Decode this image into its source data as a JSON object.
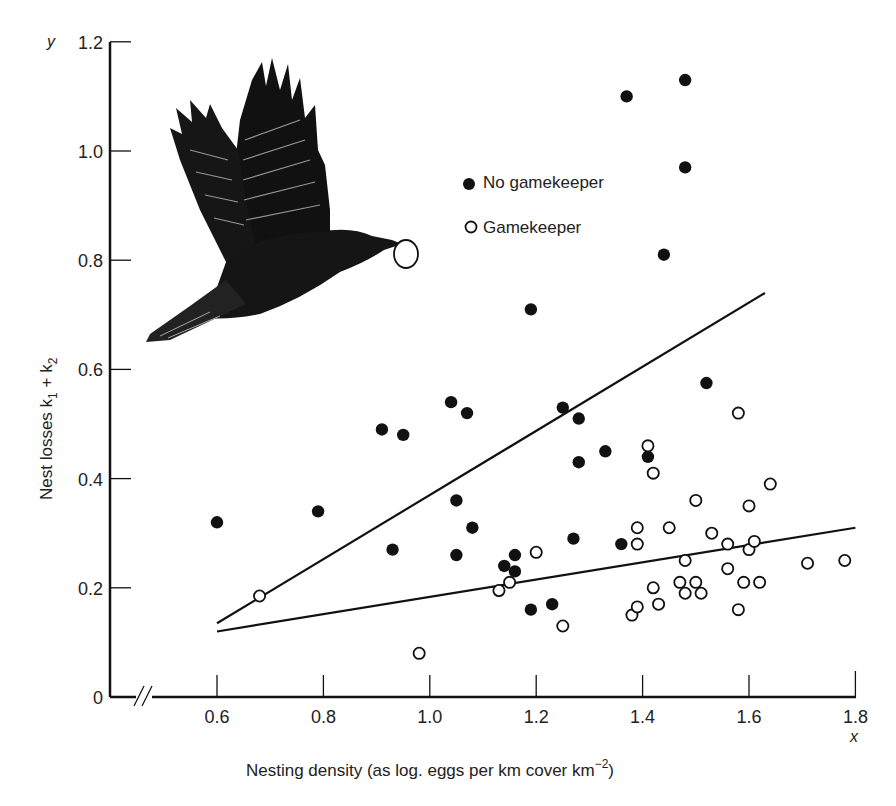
{
  "chart_data": {
    "type": "scatter",
    "title": "",
    "xlabel": "Nesting density (as log. eggs per km cover km",
    "xlabel_superscript": "−2",
    "xlabel_close": ")",
    "ylabel": "Nest losses k",
    "ylabel_sub1": "1",
    "ylabel_plus": " + k",
    "ylabel_sub2": "2",
    "x_var": "x",
    "y_var": "y",
    "xlim": [
      0.45,
      1.8
    ],
    "ylim": [
      0,
      1.2
    ],
    "x_ticks": [
      "0.6",
      "0.8",
      "1.0",
      "1.2",
      "1.4",
      "1.6",
      "1.8"
    ],
    "x_tick_values": [
      0.6,
      0.8,
      1.0,
      1.2,
      1.4,
      1.6,
      1.8
    ],
    "y_ticks": [
      "0",
      "0.2",
      "0.4",
      "0.6",
      "0.8",
      "1.0",
      "1.2"
    ],
    "y_tick_values": [
      0,
      0.2,
      0.4,
      0.6,
      0.8,
      1.0,
      1.2
    ],
    "axis_break": "x-axis broken between 0 and 0.6",
    "grid": false,
    "legend_position": "upper center",
    "illustration": "crow-carrying-egg-drawing",
    "series": [
      {
        "name": "No gamekeeper",
        "marker": "filled-circle",
        "points": [
          [
            0.6,
            0.32
          ],
          [
            0.79,
            0.34
          ],
          [
            0.91,
            0.49
          ],
          [
            0.93,
            0.27
          ],
          [
            0.95,
            0.48
          ],
          [
            1.04,
            0.54
          ],
          [
            1.05,
            0.36
          ],
          [
            1.05,
            0.26
          ],
          [
            1.07,
            0.52
          ],
          [
            1.08,
            0.31
          ],
          [
            1.14,
            0.24
          ],
          [
            1.16,
            0.26
          ],
          [
            1.16,
            0.23
          ],
          [
            1.19,
            0.16
          ],
          [
            1.19,
            0.71
          ],
          [
            1.23,
            0.17
          ],
          [
            1.25,
            0.53
          ],
          [
            1.27,
            0.29
          ],
          [
            1.28,
            0.51
          ],
          [
            1.28,
            0.43
          ],
          [
            1.33,
            0.45
          ],
          [
            1.36,
            0.28
          ],
          [
            1.37,
            1.1
          ],
          [
            1.41,
            0.44
          ],
          [
            1.44,
            0.81
          ],
          [
            1.48,
            1.13
          ],
          [
            1.48,
            0.97
          ],
          [
            1.52,
            0.575
          ]
        ],
        "regression_line": [
          [
            0.6,
            0.135
          ],
          [
            1.63,
            0.74
          ]
        ]
      },
      {
        "name": "Gamekeeper",
        "marker": "open-circle",
        "points": [
          [
            0.68,
            0.185
          ],
          [
            0.98,
            0.08
          ],
          [
            1.13,
            0.195
          ],
          [
            1.15,
            0.21
          ],
          [
            1.2,
            0.265
          ],
          [
            1.25,
            0.13
          ],
          [
            1.38,
            0.15
          ],
          [
            1.39,
            0.165
          ],
          [
            1.39,
            0.31
          ],
          [
            1.39,
            0.28
          ],
          [
            1.41,
            0.46
          ],
          [
            1.42,
            0.41
          ],
          [
            1.42,
            0.2
          ],
          [
            1.43,
            0.17
          ],
          [
            1.45,
            0.31
          ],
          [
            1.47,
            0.21
          ],
          [
            1.48,
            0.25
          ],
          [
            1.48,
            0.19
          ],
          [
            1.5,
            0.36
          ],
          [
            1.5,
            0.21
          ],
          [
            1.51,
            0.19
          ],
          [
            1.53,
            0.3
          ],
          [
            1.56,
            0.28
          ],
          [
            1.56,
            0.235
          ],
          [
            1.58,
            0.52
          ],
          [
            1.58,
            0.16
          ],
          [
            1.59,
            0.21
          ],
          [
            1.6,
            0.35
          ],
          [
            1.6,
            0.27
          ],
          [
            1.61,
            0.285
          ],
          [
            1.62,
            0.21
          ],
          [
            1.64,
            0.39
          ],
          [
            1.71,
            0.245
          ],
          [
            1.78,
            0.25
          ]
        ],
        "regression_line": [
          [
            0.6,
            0.12
          ],
          [
            1.8,
            0.31
          ]
        ]
      }
    ]
  },
  "legend": {
    "items": [
      {
        "label": "No gamekeeper",
        "marker": "filled-circle"
      },
      {
        "label": "Gamekeeper",
        "marker": "open-circle"
      }
    ]
  }
}
